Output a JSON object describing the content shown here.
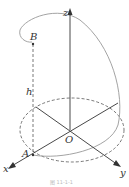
{
  "figure": {
    "labels": {
      "z": "z",
      "x": "x",
      "y": "y",
      "origin": "O",
      "point_a": "A",
      "point_b": "B",
      "height": "h"
    },
    "caption": "图 11-1-1",
    "colors": {
      "axis": "#333333",
      "helix": "#999999",
      "dashed": "#555555"
    }
  }
}
